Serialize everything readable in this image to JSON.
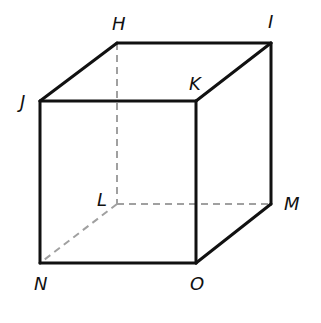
{
  "diagram": {
    "type": "cube",
    "colors": {
      "solid": "#111111",
      "hidden": "#a0a0a0"
    },
    "vertices": {
      "H": {
        "label": "H",
        "x": 117,
        "y": 43,
        "lx": 112,
        "ly": 30
      },
      "I": {
        "label": "I",
        "x": 271,
        "y": 43,
        "lx": 268,
        "ly": 28
      },
      "J": {
        "label": "J",
        "x": 40,
        "y": 101,
        "lx": 20,
        "ly": 108
      },
      "K": {
        "label": "K",
        "x": 196,
        "y": 101,
        "lx": 189,
        "ly": 90
      },
      "L": {
        "label": "L",
        "x": 117,
        "y": 204,
        "lx": 97,
        "ly": 206
      },
      "M": {
        "label": "M",
        "x": 271,
        "y": 204,
        "lx": 284,
        "ly": 210
      },
      "N": {
        "label": "N",
        "x": 40,
        "y": 263,
        "lx": 34,
        "ly": 290
      },
      "O": {
        "label": "O",
        "x": 196,
        "y": 263,
        "lx": 190,
        "ly": 290
      }
    },
    "solid_edges": [
      [
        "H",
        "I"
      ],
      [
        "J",
        "K"
      ],
      [
        "H",
        "J"
      ],
      [
        "I",
        "K"
      ],
      [
        "J",
        "N"
      ],
      [
        "K",
        "O"
      ],
      [
        "I",
        "M"
      ],
      [
        "N",
        "O"
      ],
      [
        "O",
        "M"
      ]
    ],
    "hidden_edges": [
      [
        "H",
        "L"
      ],
      [
        "L",
        "M"
      ],
      [
        "L",
        "N"
      ]
    ]
  }
}
